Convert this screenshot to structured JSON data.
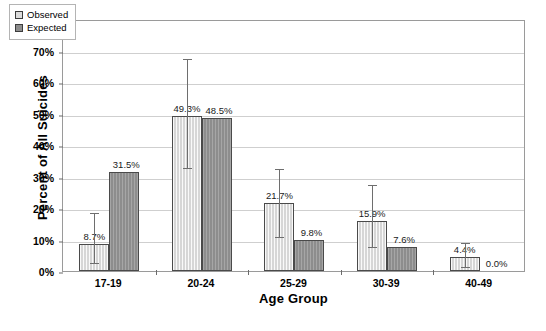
{
  "chart_data": {
    "type": "bar",
    "title": "",
    "xlabel": "Age Group",
    "ylabel": "Percent of All Suicides",
    "categories": [
      "17-19",
      "20-24",
      "25-29",
      "30-39",
      "40-49"
    ],
    "ylim": [
      0,
      80
    ],
    "ytick_labels": [
      "0%",
      "10%",
      "20%",
      "30%",
      "40%",
      "50%",
      "60%",
      "70%",
      "80%"
    ],
    "ytick_values": [
      0,
      10,
      20,
      30,
      40,
      50,
      60,
      70,
      80
    ],
    "grid": true,
    "legend_position": "top-left",
    "series": [
      {
        "name": "Observed",
        "color": "#d6d6d6",
        "values": [
          8.7,
          49.3,
          21.7,
          15.9,
          4.4
        ],
        "labels": [
          "8.7%",
          "49.3%",
          "21.7%",
          "15.9%",
          "4.4%"
        ],
        "error_low": [
          3.0,
          33.0,
          11.0,
          8.0,
          1.5
        ],
        "error_high": [
          19.0,
          68.0,
          33.0,
          28.0,
          9.5
        ]
      },
      {
        "name": "Expected",
        "color": "#8d8d8d",
        "values": [
          31.5,
          48.5,
          9.8,
          7.6,
          0.0
        ],
        "labels": [
          "31.5%",
          "48.5%",
          "9.8%",
          "7.6%",
          "0.0%"
        ],
        "error_low": [
          null,
          null,
          null,
          null,
          null
        ],
        "error_high": [
          null,
          null,
          null,
          null,
          null
        ]
      }
    ]
  },
  "legend": {
    "items": [
      {
        "label": "Observed"
      },
      {
        "label": "Expected"
      }
    ]
  },
  "caption": {
    "text": ""
  }
}
